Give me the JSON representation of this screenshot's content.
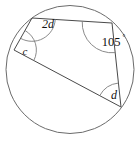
{
  "figure": {
    "type": "geometry-diagram",
    "shape": "circle",
    "inscribed_shape": "quadrilateral",
    "stroke_color": "#6b6b6b",
    "chord_color": "#4a4a4a",
    "arc_color": "#7d7d7d",
    "label_color": "#111111",
    "background": "#ffffff",
    "circle": {
      "cx": 70,
      "cy": 69.5,
      "r": 64
    },
    "vertices": [
      {
        "id": "A",
        "x": 32,
        "y": 18,
        "angle_label": "2d"
      },
      {
        "id": "B",
        "x": 112,
        "y": 23,
        "angle_label": "105"
      },
      {
        "id": "C",
        "x": 121,
        "y": 107,
        "angle_label": "d"
      },
      {
        "id": "D",
        "x": 14,
        "y": 50,
        "angle_label": "c"
      }
    ],
    "labels": {
      "top_left": "2d",
      "top_right": "105",
      "top_right_degree": "°",
      "bottom_right": "d",
      "left": "c"
    },
    "label_positions": {
      "top_left": {
        "x": 48,
        "y": 25
      },
      "top_right": {
        "x": 111,
        "y": 43
      },
      "top_right_deg": {
        "x": 124,
        "y": 37
      },
      "bottom_right": {
        "x": 114,
        "y": 96
      },
      "left": {
        "x": 25,
        "y": 52
      }
    }
  }
}
